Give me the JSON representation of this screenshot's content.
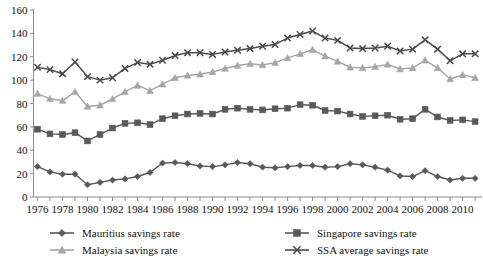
{
  "chart_data": {
    "type": "line",
    "title": "",
    "subtitle": "",
    "xlabel": "",
    "ylabel": "",
    "ylim": [
      0,
      160
    ],
    "ytick_step": 20,
    "yticks": [
      0,
      20,
      40,
      60,
      80,
      100,
      120,
      140,
      160
    ],
    "grid": false,
    "legend_position": "bottom",
    "x": [
      1976,
      1977,
      1978,
      1979,
      1980,
      1981,
      1982,
      1983,
      1984,
      1985,
      1986,
      1987,
      1988,
      1989,
      1990,
      1991,
      1992,
      1993,
      1994,
      1995,
      1996,
      1997,
      1998,
      1999,
      2000,
      2001,
      2002,
      2003,
      2004,
      2005,
      2006,
      2007,
      2008,
      2009,
      2010,
      2011
    ],
    "xtick_labels": [
      "1976",
      "1978",
      "1980",
      "1982",
      "1984",
      "1986",
      "1988",
      "1990",
      "1992",
      "1994",
      "1996",
      "1998",
      "2000",
      "2002",
      "2004",
      "2006",
      "2008",
      "2010"
    ],
    "series": [
      {
        "name": "Mauritius savings rate",
        "marker": "diamond",
        "color": "#595959",
        "values": [
          26,
          21.5,
          19.5,
          19.5,
          10.5,
          12.5,
          14.5,
          15.5,
          17.5,
          21,
          29,
          29.5,
          28.5,
          26.5,
          26,
          27.5,
          29.5,
          28.5,
          25.5,
          25,
          26,
          27,
          27,
          25.5,
          26,
          28.5,
          27.5,
          25.5,
          23,
          18,
          17.5,
          22.5,
          17.5,
          14.5,
          16,
          16
        ]
      },
      {
        "name": "Singapore savings rate",
        "marker": "square",
        "color": "#595959",
        "values": [
          58,
          54,
          53.5,
          55,
          48,
          53.5,
          59,
          63,
          63.5,
          62,
          67,
          69.5,
          71,
          71.5,
          71,
          75,
          76,
          75,
          74.5,
          75.5,
          76,
          79,
          78.5,
          74,
          73.5,
          71,
          69,
          69.5,
          70,
          66.5,
          67,
          75,
          68.5,
          65.5,
          66,
          64.5
        ]
      },
      {
        "name": "Malaysia savings rate",
        "marker": "triangle",
        "color": "#a6a6a6",
        "values": [
          88.5,
          84,
          82.5,
          90,
          77.5,
          78.5,
          84,
          90,
          95.5,
          91,
          96.5,
          102,
          104,
          105,
          107,
          110,
          112.5,
          114,
          113,
          115,
          119,
          122.5,
          126,
          120.5,
          116,
          111,
          110.5,
          111.5,
          113.5,
          109.5,
          110.5,
          117,
          110.5,
          101,
          104.5,
          102
        ]
      },
      {
        "name": "SSA average savings rate",
        "marker": "cross",
        "color": "#4a4a4a",
        "values": [
          111,
          109,
          105.5,
          115.5,
          103,
          100,
          102,
          110,
          115,
          113.5,
          117,
          121,
          123.5,
          123.5,
          122,
          124,
          125.5,
          127,
          129,
          130.5,
          136,
          139,
          142,
          136,
          134,
          127.5,
          127,
          127.5,
          129,
          125,
          126.5,
          134.5,
          126.5,
          116.5,
          122.5,
          122.5
        ]
      }
    ]
  },
  "legend": {
    "entries": [
      {
        "label": "Mauritius savings rate",
        "marker": "diamond",
        "color": "#595959"
      },
      {
        "label": "Singapore savings rate",
        "marker": "square",
        "color": "#595959"
      },
      {
        "label": "Malaysia savings rate",
        "marker": "triangle",
        "color": "#a6a6a6"
      },
      {
        "label": "SSA average savings rate",
        "marker": "cross",
        "color": "#4a4a4a"
      }
    ]
  }
}
